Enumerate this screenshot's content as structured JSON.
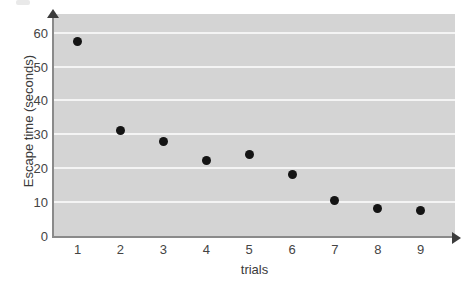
{
  "chart_data": {
    "type": "scatter",
    "title": "",
    "xlabel": "trials",
    "ylabel": "Escape time (seconds)",
    "x": [
      1,
      2,
      3,
      4,
      5,
      6,
      7,
      8,
      9
    ],
    "values": [
      57.5,
      31.2,
      27.8,
      22.3,
      24.0,
      18.2,
      10.5,
      8.0,
      7.6
    ],
    "series": [
      {
        "name": "Escape time",
        "values": [
          57.5,
          31.2,
          27.8,
          22.3,
          24.0,
          18.2,
          10.5,
          8.0,
          7.6
        ]
      }
    ],
    "xtick_labels": [
      "1",
      "2",
      "3",
      "4",
      "5",
      "6",
      "7",
      "8",
      "9"
    ],
    "ytick_labels": [
      "0",
      "10",
      "20",
      "30",
      "40",
      "50",
      "60"
    ],
    "ytick_values": [
      0,
      10,
      20,
      30,
      40,
      50,
      60
    ],
    "xlim": [
      0.45,
      9.8
    ],
    "ylim": [
      0,
      65.5
    ],
    "grid": "horizontal",
    "legend": "none",
    "marker": "filled-circle",
    "marker_color": "#141414",
    "plot_background": "#d4d4d4",
    "gridline_color": "#f4f4f4",
    "axis_color": "#8a8a8a"
  }
}
